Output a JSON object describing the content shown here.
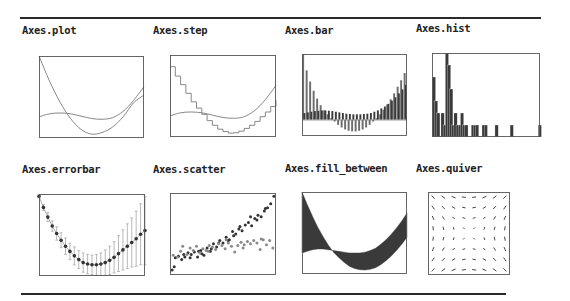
{
  "figure": {
    "top_rule": {
      "x1": 20,
      "x2": 541,
      "y": 17
    },
    "bottom_rule": {
      "x1": 21,
      "x2": 506,
      "y": 293
    },
    "colors": {
      "ink": "#333333",
      "frame": "#555555",
      "line": "#888888",
      "fill": "#3a3a3a",
      "light": "#999999"
    }
  },
  "chart_data": [
    {
      "id": "plot",
      "title": "Axes.plot",
      "type": "line",
      "label_pos": [
        22,
        24
      ],
      "frame": [
        39,
        56,
        105,
        82
      ],
      "xlim": [
        0,
        10
      ],
      "ylim": [
        -0.5,
        10
      ],
      "series": [
        {
          "name": "line1",
          "expr": "quadratic",
          "x": [
            0,
            1,
            2,
            3,
            4,
            5,
            6,
            7,
            8,
            9,
            10
          ],
          "values": [
            10,
            6.8,
            4.1,
            2.0,
            0.6,
            0,
            0.2,
            0.9,
            2.2,
            4.0,
            5.0
          ]
        },
        {
          "name": "line2",
          "expr": "cubic-ish",
          "x": [
            0,
            1,
            2,
            3,
            4,
            5,
            6,
            7,
            8,
            9,
            10
          ],
          "values": [
            2.2,
            2.6,
            2.7,
            2.6,
            2.3,
            2.0,
            1.9,
            2.1,
            2.9,
            4.3,
            6.1
          ]
        }
      ]
    },
    {
      "id": "step",
      "title": "Axes.step",
      "type": "line",
      "label_pos": [
        153,
        24
      ],
      "frame": [
        170,
        55,
        106,
        82
      ],
      "xlim": [
        0,
        10
      ],
      "ylim": [
        -0.5,
        10
      ],
      "series": [
        {
          "name": "step1",
          "x": [
            0,
            0.5,
            1,
            1.5,
            2,
            2.5,
            3,
            3.5,
            4,
            4.5,
            5,
            5.5,
            6,
            6.5,
            7,
            7.5,
            8,
            8.5,
            9,
            9.5,
            10
          ],
          "values": [
            8.5,
            7.3,
            6.2,
            5.1,
            4.0,
            3.2,
            2.4,
            1.6,
            1.0,
            0.5,
            0.2,
            0.0,
            0.05,
            0.25,
            0.6,
            1.0,
            1.5,
            2.1,
            2.7,
            3.4,
            4.2
          ]
        },
        {
          "name": "line2",
          "x": [
            0,
            1,
            2,
            3,
            4,
            5,
            6,
            7,
            8,
            9,
            10
          ],
          "values": [
            2.2,
            2.6,
            2.7,
            2.6,
            2.3,
            2.0,
            1.9,
            2.1,
            2.9,
            4.3,
            6.1
          ]
        }
      ]
    },
    {
      "id": "bar",
      "title": "Axes.bar",
      "type": "bar",
      "label_pos": [
        285,
        24
      ],
      "frame": [
        302,
        54,
        105,
        82
      ],
      "ylim": [
        -2.5,
        10
      ],
      "series": [
        {
          "name": "light",
          "values": [
            10,
            7.5,
            5.8,
            4.4,
            3.2,
            2.2,
            1.4,
            0.8,
            0.2,
            -0.3,
            -0.8,
            -1.2,
            -1.5,
            -1.7,
            -1.8,
            -1.8,
            -1.7,
            -1.5,
            -1.2,
            -0.8,
            -0.3,
            0.2,
            0.8,
            1.5,
            2.3,
            3.1,
            4.0,
            5.0,
            6.0,
            7.1
          ]
        },
        {
          "name": "dark",
          "values": [
            1.0,
            1.1,
            1.2,
            1.3,
            1.35,
            1.4,
            1.4,
            1.35,
            1.3,
            1.2,
            1.1,
            1.0,
            0.9,
            0.85,
            0.8,
            0.8,
            0.8,
            0.85,
            0.9,
            1.0,
            1.2,
            1.4,
            1.7,
            2.0,
            2.4,
            2.9,
            3.4,
            4.0,
            4.6,
            5.3
          ]
        }
      ]
    },
    {
      "id": "hist",
      "title": "Axes.hist",
      "type": "bar",
      "label_pos": [
        416,
        22
      ],
      "frame": [
        432,
        53,
        108,
        84
      ],
      "ylim": [
        0,
        7
      ],
      "bins": [
        0,
        1,
        2,
        3,
        4,
        5,
        6,
        7,
        8,
        9,
        10,
        11,
        12,
        13,
        14,
        15,
        16,
        17,
        18,
        19,
        20,
        21,
        22,
        23,
        24,
        25,
        26,
        27,
        28,
        29,
        30,
        31,
        32,
        33,
        34,
        35,
        36,
        37,
        38,
        39,
        40,
        41,
        42,
        43,
        44,
        45,
        46,
        47,
        48,
        49
      ],
      "values": [
        5,
        3,
        2,
        0,
        2,
        1,
        7,
        6,
        4,
        1,
        2,
        1,
        1,
        2,
        1,
        1,
        0,
        0,
        1,
        1,
        1,
        0,
        0,
        1,
        1,
        0,
        0,
        0,
        0,
        1,
        0,
        0,
        0,
        0,
        0,
        0,
        1,
        0,
        0,
        0,
        0,
        0,
        0,
        0,
        0,
        0,
        0,
        0,
        0,
        1
      ]
    },
    {
      "id": "errorbar",
      "title": "Axes.errorbar",
      "type": "line",
      "label_pos": [
        22,
        163
      ],
      "frame": [
        39,
        194,
        106,
        82
      ],
      "xlim": [
        0,
        24
      ],
      "ylim": [
        -1,
        10
      ],
      "x": [
        0,
        1,
        2,
        3,
        4,
        5,
        6,
        7,
        8,
        9,
        10,
        11,
        12,
        13,
        14,
        15,
        16,
        17,
        18,
        19,
        20,
        21,
        22,
        23,
        24
      ],
      "values": [
        9.7,
        8.2,
        6.9,
        5.7,
        4.7,
        3.8,
        3.0,
        2.3,
        1.7,
        1.2,
        0.8,
        0.6,
        0.5,
        0.5,
        0.6,
        0.8,
        1.1,
        1.5,
        2.0,
        2.5,
        3.0,
        3.5,
        4.0,
        4.6,
        5.1
      ],
      "errors": [
        0.2,
        0.4,
        0.6,
        0.7,
        0.9,
        1.0,
        1.1,
        1.1,
        1.2,
        1.2,
        1.3,
        1.3,
        1.3,
        1.4,
        1.5,
        1.7,
        1.9,
        2.1,
        2.4,
        2.7,
        3.0,
        3.3,
        3.7,
        4.1,
        4.6
      ]
    },
    {
      "id": "scatter",
      "title": "Axes.scatter",
      "type": "scatter",
      "label_pos": [
        153,
        163
      ],
      "frame": [
        170,
        193,
        106,
        82
      ],
      "xlim": [
        0,
        10
      ],
      "ylim": [
        0,
        10
      ],
      "series": [
        {
          "name": "dark",
          "points": [
            [
              0.2,
              0.6
            ],
            [
              0.5,
              2.1
            ],
            [
              0.8,
              2.3
            ],
            [
              1.1,
              1.9
            ],
            [
              1.4,
              2.2
            ],
            [
              1.7,
              2.7
            ],
            [
              2.0,
              2.5
            ],
            [
              2.3,
              2.8
            ],
            [
              2.6,
              2.2
            ],
            [
              2.9,
              3.0
            ],
            [
              3.2,
              2.4
            ],
            [
              3.5,
              3.3
            ],
            [
              3.8,
              2.9
            ],
            [
              4.1,
              3.8
            ],
            [
              4.4,
              3.4
            ],
            [
              4.7,
              4.2
            ],
            [
              5.0,
              3.9
            ],
            [
              5.3,
              4.6
            ],
            [
              5.6,
              4.3
            ],
            [
              5.9,
              5.3
            ],
            [
              6.2,
              5.0
            ],
            [
              6.5,
              5.6
            ],
            [
              6.8,
              5.4
            ],
            [
              7.1,
              6.1
            ],
            [
              7.4,
              6.4
            ],
            [
              7.7,
              6.0
            ],
            [
              8.0,
              6.9
            ],
            [
              8.3,
              7.3
            ],
            [
              8.6,
              7.1
            ],
            [
              8.9,
              7.8
            ],
            [
              9.2,
              8.2
            ],
            [
              9.5,
              8.7
            ],
            [
              9.8,
              9.6
            ],
            [
              0.4,
              1.0
            ],
            [
              1.3,
              2.5
            ],
            [
              3.0,
              2.6
            ],
            [
              4.6,
              3.9
            ],
            [
              6.0,
              4.8
            ],
            [
              7.6,
              7.1
            ],
            [
              9.0,
              8.1
            ],
            [
              1.9,
              2.1
            ],
            [
              2.7,
              2.9
            ],
            [
              3.9,
              3.2
            ],
            [
              5.5,
              4.2
            ],
            [
              6.6,
              5.9
            ],
            [
              8.2,
              6.7
            ]
          ]
        },
        {
          "name": "light",
          "points": [
            [
              0.3,
              2.4
            ],
            [
              0.7,
              2.2
            ],
            [
              1.0,
              2.9
            ],
            [
              1.6,
              2.5
            ],
            [
              1.9,
              3.3
            ],
            [
              2.2,
              3.0
            ],
            [
              2.5,
              3.5
            ],
            [
              2.8,
              2.7
            ],
            [
              3.1,
              3.2
            ],
            [
              3.4,
              3.0
            ],
            [
              3.7,
              3.6
            ],
            [
              4.0,
              3.4
            ],
            [
              4.3,
              3.1
            ],
            [
              4.6,
              3.8
            ],
            [
              4.9,
              3.6
            ],
            [
              5.2,
              3.2
            ],
            [
              5.5,
              3.9
            ],
            [
              5.8,
              3.5
            ],
            [
              6.1,
              2.8
            ],
            [
              6.4,
              3.6
            ],
            [
              6.7,
              4.0
            ],
            [
              7.0,
              3.7
            ],
            [
              7.3,
              4.1
            ],
            [
              7.6,
              3.8
            ],
            [
              7.9,
              4.2
            ],
            [
              8.2,
              3.9
            ],
            [
              8.5,
              3.1
            ],
            [
              8.8,
              4.3
            ],
            [
              9.1,
              3.7
            ],
            [
              9.4,
              4.2
            ],
            [
              9.7,
              3.3
            ],
            [
              1.2,
              3.5
            ],
            [
              3.6,
              2.9
            ],
            [
              5.3,
              4.3
            ],
            [
              6.9,
              3.3
            ],
            [
              8.6,
              4.4
            ]
          ]
        }
      ]
    },
    {
      "id": "fill_between",
      "title": "Axes.fill_between",
      "type": "area",
      "label_pos": [
        285,
        162
      ],
      "frame": [
        302,
        192,
        105,
        82
      ],
      "xlim": [
        0,
        10
      ],
      "ylim": [
        -0.5,
        10
      ],
      "x": [
        0,
        0.5,
        1,
        1.5,
        2,
        2.5,
        3,
        3.5,
        4,
        4.5,
        5,
        5.5,
        6,
        6.5,
        7,
        7.5,
        8,
        8.5,
        9,
        9.5,
        10
      ],
      "y1": [
        10,
        8.4,
        6.9,
        5.5,
        4.3,
        3.2,
        2.3,
        1.6,
        1.0,
        0.5,
        0.2,
        0.05,
        0.0,
        0.1,
        0.3,
        0.7,
        1.2,
        1.8,
        2.5,
        3.3,
        4.2
      ],
      "y2": [
        2.2,
        2.4,
        2.6,
        2.7,
        2.7,
        2.6,
        2.5,
        2.4,
        2.3,
        2.2,
        2.2,
        2.2,
        2.3,
        2.5,
        2.8,
        3.3,
        3.9,
        4.6,
        5.4,
        6.3,
        7.3
      ]
    },
    {
      "id": "quiver",
      "title": "Axes.quiver",
      "type": "quiver",
      "label_pos": [
        416,
        162
      ],
      "frame": [
        428,
        192,
        82,
        83
      ],
      "grid": [
        8,
        8
      ],
      "field": "radial-outward"
    }
  ]
}
